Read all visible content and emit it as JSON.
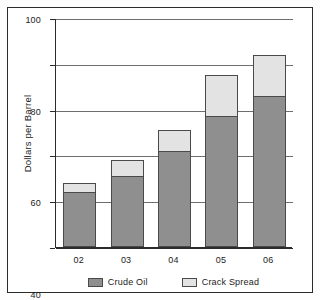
{
  "chart_data": {
    "type": "bar",
    "subtype": "stacked-bar",
    "title": "",
    "xlabel": "",
    "ylabel": "Dollars per Barrel",
    "categories": [
      "02",
      "03",
      "04",
      "05",
      "06"
    ],
    "series": [
      {
        "name": "Crude Oil",
        "color": "#8f8f8f",
        "values": [
          24,
          31,
          42,
          57,
          66
        ]
      },
      {
        "name": "Crack Spread",
        "color": "#e3e3e3",
        "values": [
          4,
          7,
          9,
          18,
          18
        ]
      }
    ],
    "totals": [
      28,
      38,
      51,
      75,
      84
    ],
    "ylim": [
      0,
      100
    ],
    "yticks": [
      0,
      20,
      40,
      60,
      80,
      100
    ],
    "ytick_labels": [
      "0",
      "20",
      "40",
      "60",
      "80",
      "100"
    ],
    "grid": true,
    "grid_axis": "y",
    "legend_position": "bottom",
    "legend": [
      "Crude Oil",
      "Crack Spread"
    ],
    "frame": true,
    "background_color": "#ffffff",
    "axis_color": "#2b2b2b"
  }
}
